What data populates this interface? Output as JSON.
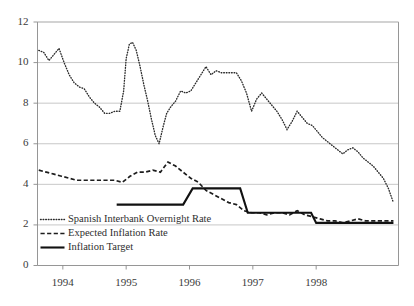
{
  "chart_data": {
    "type": "line",
    "title": "",
    "xlabel": "",
    "ylabel": "",
    "ylim": [
      0,
      12
    ],
    "yticks": [
      0,
      2,
      4,
      6,
      8,
      10,
      12
    ],
    "xlim": [
      1993.6,
      1999.3
    ],
    "xticks": [
      1994,
      1995,
      1996,
      1997,
      1998
    ],
    "xtick_labels": [
      "1994",
      "1995",
      "1996",
      "1997",
      "1998"
    ],
    "grid": true,
    "legend_position": "lower-left inside plot",
    "series": [
      {
        "name": "Spanish Interbank Overnight Rate",
        "style": "dotted",
        "x": [
          1993.62,
          1993.7,
          1993.78,
          1993.86,
          1993.94,
          1994.02,
          1994.1,
          1994.18,
          1994.26,
          1994.34,
          1994.42,
          1994.5,
          1994.58,
          1994.66,
          1994.74,
          1994.82,
          1994.9,
          1994.96,
          1995.0,
          1995.05,
          1995.1,
          1995.16,
          1995.22,
          1995.28,
          1995.34,
          1995.4,
          1995.46,
          1995.52,
          1995.58,
          1995.64,
          1995.7,
          1995.78,
          1995.86,
          1995.94,
          1996.02,
          1996.1,
          1996.18,
          1996.26,
          1996.34,
          1996.42,
          1996.5,
          1996.58,
          1996.66,
          1996.74,
          1996.82,
          1996.9,
          1996.98,
          1997.06,
          1997.14,
          1997.22,
          1997.3,
          1997.38,
          1997.46,
          1997.54,
          1997.62,
          1997.7,
          1997.78,
          1997.86,
          1997.94,
          1998.02,
          1998.1,
          1998.18,
          1998.26,
          1998.34,
          1998.42,
          1998.5,
          1998.58,
          1998.66,
          1998.74,
          1998.82,
          1998.9,
          1998.98,
          1999.06,
          1999.14,
          1999.22
        ],
        "y": [
          10.6,
          10.5,
          10.1,
          10.4,
          10.7,
          10.0,
          9.4,
          9.0,
          8.8,
          8.7,
          8.3,
          8.0,
          7.8,
          7.5,
          7.5,
          7.6,
          7.6,
          8.6,
          10.2,
          10.9,
          11.0,
          10.6,
          9.8,
          8.9,
          8.1,
          7.2,
          6.4,
          6.0,
          6.8,
          7.5,
          7.8,
          8.1,
          8.6,
          8.5,
          8.6,
          9.0,
          9.4,
          9.8,
          9.4,
          9.6,
          9.5,
          9.5,
          9.5,
          9.5,
          9.1,
          8.5,
          7.6,
          8.2,
          8.5,
          8.2,
          7.9,
          7.6,
          7.2,
          6.7,
          7.1,
          7.6,
          7.3,
          7.0,
          6.9,
          6.6,
          6.3,
          6.1,
          5.9,
          5.7,
          5.5,
          5.7,
          5.8,
          5.6,
          5.3,
          5.1,
          4.9,
          4.6,
          4.3,
          3.8,
          3.1
        ]
      },
      {
        "name": "Expected Inflation Rate",
        "style": "dashed",
        "x": [
          1993.62,
          1993.74,
          1993.86,
          1993.98,
          1994.1,
          1994.22,
          1994.34,
          1994.46,
          1994.58,
          1994.7,
          1994.82,
          1994.94,
          1995.06,
          1995.18,
          1995.3,
          1995.42,
          1995.54,
          1995.66,
          1995.78,
          1995.9,
          1996.02,
          1996.14,
          1996.26,
          1996.38,
          1996.5,
          1996.62,
          1996.74,
          1996.86,
          1996.98,
          1997.1,
          1997.22,
          1997.34,
          1997.46,
          1997.58,
          1997.7,
          1997.82,
          1997.94,
          1998.06,
          1998.18,
          1998.3,
          1998.42,
          1998.54,
          1998.66,
          1998.78,
          1998.9,
          1999.02,
          1999.14,
          1999.22
        ],
        "y": [
          4.7,
          4.6,
          4.5,
          4.4,
          4.3,
          4.2,
          4.2,
          4.2,
          4.2,
          4.2,
          4.2,
          4.1,
          4.4,
          4.6,
          4.6,
          4.7,
          4.6,
          5.1,
          4.9,
          4.6,
          4.3,
          4.1,
          3.7,
          3.5,
          3.3,
          3.1,
          3.0,
          2.7,
          2.6,
          2.6,
          2.5,
          2.6,
          2.6,
          2.5,
          2.7,
          2.5,
          2.4,
          2.3,
          2.2,
          2.2,
          2.1,
          2.2,
          2.3,
          2.2,
          2.2,
          2.2,
          2.2,
          2.2
        ]
      },
      {
        "name": "Inflation Target",
        "style": "solid",
        "x": [
          1994.85,
          1995.9,
          1996.05,
          1996.8,
          1996.92,
          1997.8,
          1997.92,
          1998.0,
          1998.1,
          1999.22
        ],
        "y": [
          3.0,
          3.0,
          3.8,
          3.8,
          2.6,
          2.6,
          2.6,
          2.1,
          2.1,
          2.1
        ]
      }
    ],
    "legend": [
      {
        "label": "Spanish Interbank Overnight Rate",
        "style": "dotted"
      },
      {
        "label": "Expected Inflation Rate",
        "style": "dashed"
      },
      {
        "label": "Inflation Target",
        "style": "solid"
      }
    ]
  }
}
